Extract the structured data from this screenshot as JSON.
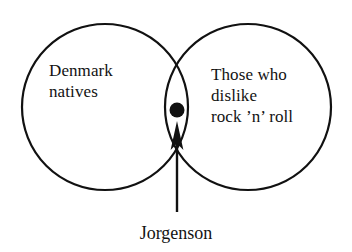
{
  "figure": {
    "type": "venn-diagram",
    "background_color": "#ffffff",
    "stroke_color": "#111111",
    "stroke_width": 2.2
  },
  "sets": {
    "left": {
      "name": "denmark-natives",
      "label": "Denmark\nnatives",
      "label_lines": [
        "Denmark",
        "natives"
      ],
      "center_x": 105,
      "center_y": 107,
      "radius": 83
    },
    "right": {
      "name": "rock-dislikers",
      "label": "Those who\ndislike\nrock ’n’ roll",
      "label_lines": [
        "Those who",
        "dislike",
        "rock ’n’ roll"
      ],
      "center_x": 248,
      "center_y": 107,
      "radius": 83
    }
  },
  "intersection": {
    "name": "intersection-lens",
    "point_marker": {
      "shape": "filled-circle",
      "color": "#111111",
      "x": 177,
      "y": 110,
      "radius": 7.5
    },
    "top_crossing_y": 45,
    "bottom_crossing_y": 168,
    "crossing_x": 176
  },
  "annotation": {
    "caption": "Jorgenson",
    "arrow": {
      "name": "pointer-arrow",
      "from_x": 177,
      "from_y": 212,
      "to_x": 177,
      "to_y": 122,
      "color": "#111111"
    }
  }
}
